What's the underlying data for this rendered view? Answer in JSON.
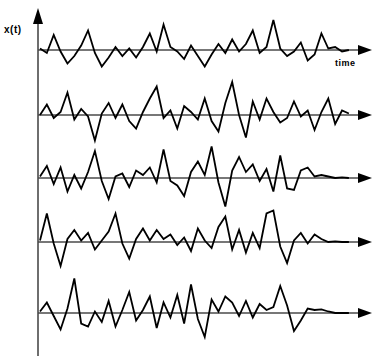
{
  "figure": {
    "title": "",
    "y_axis_label": "x(t)",
    "x_axis_label": "time",
    "background_color": "#ffffff",
    "trace_color": "#000000",
    "axis_color": "#4a4a4a",
    "trace_count": 5
  },
  "chart_data": {
    "type": "line",
    "title": "",
    "subtitle": "",
    "xlabel": "time",
    "ylabel": "x(t)",
    "xlim": [
      0,
      100
    ],
    "ylim": [
      -1.25,
      1.25
    ],
    "grid": false,
    "legend": "none",
    "annotations": [
      {
        "text": "x(t)",
        "position": "top-left-of-y-axis"
      },
      {
        "text": "time",
        "position": "below-first-axis-arrow-right-end"
      }
    ],
    "axis_arrows": {
      "y_axis": "up",
      "x_axes": "right"
    },
    "series": [
      {
        "name": "realization-1",
        "baseline_y": 50,
        "x": [
          0,
          2.2,
          4.4,
          6.6,
          8.8,
          11,
          13.2,
          15.4,
          17.6,
          19.8,
          22,
          24.2,
          26.4,
          28.6,
          30.8,
          33,
          35.2,
          37.4,
          39.6,
          41.8,
          44,
          46.2,
          48.4,
          50.6,
          52.8,
          55,
          57.2,
          59.4,
          61.6,
          63.8,
          66,
          68.2,
          70.4,
          72.6,
          74.8,
          77,
          79.2,
          81.4,
          83.6,
          85.8,
          88,
          90.2,
          92.4,
          94.6,
          96.8,
          99
        ],
        "values": [
          0.05,
          -0.1,
          0.5,
          -0.05,
          -0.45,
          -0.2,
          0.15,
          0.65,
          -0.1,
          -0.55,
          -0.25,
          0.1,
          -0.2,
          0.05,
          -0.25,
          0.1,
          0.55,
          -0.05,
          0.85,
          0.1,
          -0.05,
          -0.3,
          0.15,
          -0.2,
          -0.55,
          -0.15,
          0.2,
          -0.1,
          0.35,
          -0.05,
          0.2,
          0.65,
          -0.1,
          0.1,
          1.0,
          0.05,
          -0.2,
          -0.05,
          0.25,
          -0.35,
          -0.15,
          0.55,
          0.05,
          0.1,
          -0.05,
          0.0
        ]
      },
      {
        "name": "realization-2",
        "baseline_y": 115,
        "x": [
          0,
          2.2,
          4.4,
          6.6,
          8.8,
          11,
          13.2,
          15.4,
          17.6,
          19.8,
          22,
          24.2,
          26.4,
          28.6,
          30.8,
          33,
          35.2,
          37.4,
          39.6,
          41.8,
          44,
          46.2,
          48.4,
          50.6,
          52.8,
          55,
          57.2,
          59.4,
          61.6,
          63.8,
          66,
          68.2,
          70.4,
          72.6,
          74.8,
          77,
          79.2,
          81.4,
          83.6,
          85.8,
          88,
          90.2,
          92.4,
          94.6,
          96.8,
          99
        ],
        "values": [
          0.0,
          0.35,
          -0.1,
          0.1,
          0.75,
          -0.15,
          0.2,
          -0.05,
          -0.85,
          0.05,
          0.4,
          -0.1,
          0.35,
          -0.2,
          -0.45,
          0.1,
          0.55,
          0.95,
          -0.1,
          0.15,
          -0.45,
          0.3,
          0.1,
          -0.15,
          0.55,
          -0.2,
          -0.55,
          0.4,
          1.1,
          0.0,
          -0.75,
          0.45,
          -0.15,
          0.55,
          0.1,
          -0.25,
          -0.1,
          0.45,
          -0.05,
          0.15,
          -0.5,
          0.1,
          0.55,
          -0.3,
          0.15,
          0.05
        ]
      },
      {
        "name": "realization-3",
        "baseline_y": 178,
        "x": [
          0,
          2.2,
          4.4,
          6.6,
          8.8,
          11,
          13.2,
          15.4,
          17.6,
          19.8,
          22,
          24.2,
          26.4,
          28.6,
          30.8,
          33,
          35.2,
          37.4,
          39.6,
          41.8,
          44,
          46.2,
          48.4,
          50.6,
          52.8,
          55,
          57.2,
          59.4,
          61.6,
          63.8,
          66,
          68.2,
          70.4,
          72.6,
          74.8,
          77,
          79.2,
          81.4,
          83.6,
          85.8,
          88,
          90.2,
          92.4,
          94.6,
          96.8,
          99
        ],
        "values": [
          0.05,
          0.4,
          -0.2,
          0.35,
          -0.45,
          0.1,
          -0.35,
          0.2,
          0.9,
          -0.1,
          -0.7,
          0.05,
          0.15,
          -0.3,
          0.25,
          0.1,
          0.35,
          -0.15,
          0.95,
          -0.1,
          -0.25,
          -0.6,
          0.2,
          0.55,
          0.1,
          1.05,
          -0.15,
          -0.95,
          0.25,
          0.7,
          0.2,
          0.45,
          -0.1,
          0.3,
          -0.45,
          0.75,
          -0.35,
          -0.4,
          0.25,
          0.35,
          0.05,
          0.1,
          0.05,
          0.0,
          0.02,
          0.0
        ]
      },
      {
        "name": "realization-4",
        "baseline_y": 242,
        "x": [
          0,
          2.2,
          4.4,
          6.6,
          8.8,
          11,
          13.2,
          15.4,
          17.6,
          19.8,
          22,
          24.2,
          26.4,
          28.6,
          30.8,
          33,
          35.2,
          37.4,
          39.6,
          41.8,
          44,
          46.2,
          48.4,
          50.6,
          52.8,
          55,
          57.2,
          59.4,
          61.6,
          63.8,
          66,
          68.2,
          70.4,
          72.6,
          74.8,
          77,
          79.2,
          81.4,
          83.6,
          85.8,
          88,
          90.2,
          92.4,
          94.6,
          96.8,
          99
        ],
        "values": [
          0.05,
          0.95,
          -0.05,
          -0.8,
          0.1,
          0.4,
          0.05,
          0.3,
          -0.25,
          0.05,
          0.35,
          0.95,
          -0.05,
          -0.55,
          0.1,
          0.45,
          0.05,
          0.4,
          0.1,
          0.25,
          -0.1,
          0.15,
          -0.3,
          0.45,
          0.05,
          -0.2,
          0.5,
          0.85,
          -0.25,
          0.4,
          -0.35,
          0.3,
          -0.2,
          0.95,
          1.05,
          -0.15,
          -0.7,
          0.05,
          0.3,
          -0.05,
          0.25,
          0.1,
          0.0,
          0.02,
          0.0,
          0.0
        ]
      },
      {
        "name": "realization-5",
        "baseline_y": 313,
        "x": [
          0,
          2.2,
          4.4,
          6.6,
          8.8,
          11,
          13.2,
          15.4,
          17.6,
          19.8,
          22,
          24.2,
          26.4,
          28.6,
          30.8,
          33,
          35.2,
          37.4,
          39.6,
          41.8,
          44,
          46.2,
          48.4,
          50.6,
          52.8,
          55,
          57.2,
          59.4,
          61.6,
          63.8,
          66,
          68.2,
          70.4,
          72.6,
          74.8,
          77,
          79.2,
          81.4,
          83.6,
          85.8,
          88,
          90.2,
          92.4,
          94.6,
          96.8,
          99
        ],
        "values": [
          0.05,
          0.35,
          -0.1,
          -0.55,
          0.15,
          1.15,
          -0.35,
          -0.45,
          0.05,
          -0.3,
          0.4,
          -0.45,
          0.1,
          0.7,
          -0.25,
          0.1,
          0.55,
          -0.5,
          0.35,
          -0.15,
          0.6,
          -0.35,
          0.95,
          -0.2,
          -0.8,
          0.45,
          0.05,
          0.55,
          0.35,
          -0.1,
          0.4,
          -0.15,
          0.3,
          0.1,
          0.2,
          0.9,
          0.25,
          -0.6,
          -0.25,
          0.15,
          0.1,
          0.12,
          0.05,
          0.0,
          0.0,
          0.0
        ]
      }
    ]
  }
}
